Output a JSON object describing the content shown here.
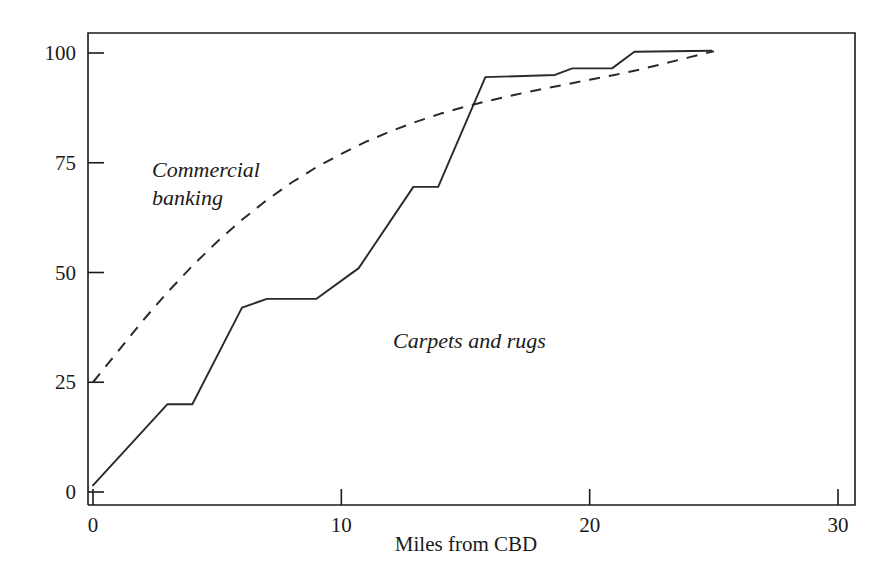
{
  "chart_data": {
    "type": "line",
    "title": "",
    "subtitle": "",
    "xlabel": "Miles from CBD",
    "ylabel": "",
    "xlim": [
      -0.6,
      30.4
    ],
    "ylim": [
      -4,
      106
    ],
    "grid": false,
    "legend_position": "inline-annotation",
    "xticks": [
      0,
      10,
      20,
      30
    ],
    "xtick_labels": [
      "0",
      "10",
      "20",
      "30"
    ],
    "yticks": [
      0,
      25,
      50,
      75,
      100
    ],
    "ytick_labels": [
      "0",
      "25",
      "50",
      "75",
      "100"
    ],
    "annotations": [
      {
        "text": "Commercial banking",
        "lines": [
          "Commercial",
          "banking"
        ],
        "x": 2.2,
        "y": 73
      },
      {
        "text": "Carpets and rugs",
        "lines": [
          "Carpets and rugs"
        ],
        "x": 12.6,
        "y": 38
      }
    ],
    "series": [
      {
        "name": "Carpets and rugs",
        "style": "solid",
        "points": [
          {
            "x": 0.0,
            "y": 1.5
          },
          {
            "x": 3.0,
            "y": 20.0
          },
          {
            "x": 4.0,
            "y": 20.0
          },
          {
            "x": 6.0,
            "y": 42.0
          },
          {
            "x": 7.0,
            "y": 44.0
          },
          {
            "x": 9.0,
            "y": 44.0
          },
          {
            "x": 10.7,
            "y": 51.0
          },
          {
            "x": 12.9,
            "y": 69.5
          },
          {
            "x": 13.9,
            "y": 69.5
          },
          {
            "x": 15.8,
            "y": 94.5
          },
          {
            "x": 18.6,
            "y": 95.0
          },
          {
            "x": 19.3,
            "y": 96.5
          },
          {
            "x": 20.9,
            "y": 96.5
          },
          {
            "x": 21.8,
            "y": 100.3
          },
          {
            "x": 24.9,
            "y": 100.5
          }
        ]
      },
      {
        "name": "Commercial banking",
        "style": "dashed",
        "points": [
          {
            "x": 0.0,
            "y": 25.0
          },
          {
            "x": 1.0,
            "y": 32.0
          },
          {
            "x": 2.0,
            "y": 39.0
          },
          {
            "x": 3.0,
            "y": 45.5
          },
          {
            "x": 4.0,
            "y": 51.5
          },
          {
            "x": 5.0,
            "y": 57.0
          },
          {
            "x": 6.0,
            "y": 62.0
          },
          {
            "x": 7.0,
            "y": 66.5
          },
          {
            "x": 8.0,
            "y": 70.5
          },
          {
            "x": 9.0,
            "y": 74.0
          },
          {
            "x": 10.0,
            "y": 77.0
          },
          {
            "x": 11.0,
            "y": 79.8
          },
          {
            "x": 12.0,
            "y": 82.2
          },
          {
            "x": 13.0,
            "y": 84.3
          },
          {
            "x": 14.0,
            "y": 86.2
          },
          {
            "x": 15.0,
            "y": 87.8
          },
          {
            "x": 16.0,
            "y": 89.2
          },
          {
            "x": 17.0,
            "y": 90.5
          },
          {
            "x": 18.0,
            "y": 91.7
          },
          {
            "x": 19.0,
            "y": 92.8
          },
          {
            "x": 20.0,
            "y": 93.9
          },
          {
            "x": 21.0,
            "y": 95.0
          },
          {
            "x": 22.0,
            "y": 96.2
          },
          {
            "x": 23.0,
            "y": 97.6
          },
          {
            "x": 24.0,
            "y": 99.0
          },
          {
            "x": 25.0,
            "y": 100.4
          }
        ]
      }
    ],
    "colors": {
      "axis": "#1a1a1a",
      "solid_series": "#2a2a2a",
      "dashed_series": "#2a2a2a",
      "background": "#ffffff"
    }
  }
}
